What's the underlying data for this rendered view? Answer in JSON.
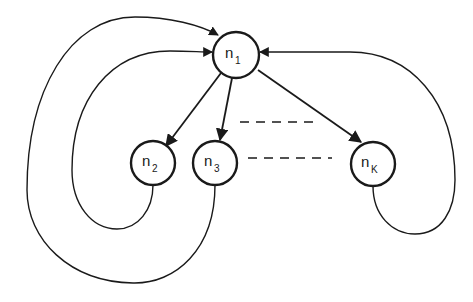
{
  "diagram": {
    "nodes": [
      {
        "id": "n1",
        "label": "n",
        "subscript": "1",
        "cx": 236,
        "cy": 55,
        "r": 23
      },
      {
        "id": "n2",
        "label": "n",
        "subscript": "2",
        "cx": 153,
        "cy": 163,
        "r": 22
      },
      {
        "id": "n3",
        "label": "n",
        "subscript": "3",
        "cx": 215,
        "cy": 163,
        "r": 22
      },
      {
        "id": "nK",
        "label": "n",
        "subscript": "K",
        "cx": 373,
        "cy": 164,
        "r": 22
      }
    ],
    "edges": [
      {
        "from": "n1",
        "to": "n2",
        "type": "directed"
      },
      {
        "from": "n1",
        "to": "n3",
        "type": "directed"
      },
      {
        "from": "n1",
        "to": "nK",
        "type": "directed"
      },
      {
        "from": "n2",
        "to": "n1",
        "type": "directed-loop"
      },
      {
        "from": "n3",
        "to": "n1",
        "type": "directed-loop"
      },
      {
        "from": "nK",
        "to": "n1",
        "type": "directed-loop"
      }
    ],
    "ellipsis": "dashed lines between n3 and nK indicating omitted nodes",
    "colors": {
      "stroke": "#1a1a1a",
      "background": "#ffffff"
    }
  }
}
